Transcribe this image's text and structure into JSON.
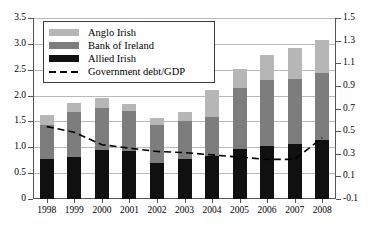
{
  "chart_data": {
    "type": "bar",
    "title": "",
    "subtitle": "",
    "xlabel": "",
    "ylabel": "",
    "y2label": "",
    "grid": true,
    "legend_position": "top-left",
    "categories": [
      "1998",
      "1999",
      "2000",
      "2001",
      "2002",
      "2003",
      "2004",
      "2005",
      "2006",
      "2007",
      "2008"
    ],
    "ylim": [
      0,
      3.5
    ],
    "yticks": [
      "0",
      "0.5",
      "1.0",
      "1.5",
      "2.0",
      "2.5",
      "3.0",
      "3.5"
    ],
    "ytick_values": [
      0,
      0.5,
      1.0,
      1.5,
      2.0,
      2.5,
      3.0,
      3.5
    ],
    "y2lim": [
      -0.1,
      1.5
    ],
    "y2ticks": [
      "-0.1",
      "0.1",
      "0.3",
      "0.5",
      "0.7",
      "0.9",
      "1.1",
      "1.3",
      "1.5"
    ],
    "y2tick_values": [
      -0.1,
      0.1,
      0.3,
      0.5,
      0.7,
      0.9,
      1.1,
      1.3,
      1.5
    ],
    "stacked": true,
    "series": [
      {
        "name": "Allied Irish",
        "key": "aib",
        "color": "#101010",
        "values": [
          0.78,
          0.82,
          0.95,
          0.92,
          0.7,
          0.77,
          0.83,
          0.97,
          1.02,
          1.07,
          1.15
        ]
      },
      {
        "name": "Bank of Ireland",
        "key": "boi",
        "color": "#7d7d7d",
        "values": [
          0.66,
          0.86,
          0.82,
          0.78,
          0.74,
          0.73,
          0.75,
          1.18,
          1.28,
          1.25,
          1.28
        ]
      },
      {
        "name": "Anglo Irish",
        "key": "anglo",
        "color": "#b6b6b6",
        "values": [
          0.19,
          0.17,
          0.18,
          0.14,
          0.13,
          0.19,
          0.52,
          0.36,
          0.49,
          0.61,
          0.65
        ]
      }
    ],
    "totals": [
      1.63,
      1.85,
      1.95,
      1.84,
      1.57,
      1.69,
      2.1,
      2.51,
      2.79,
      2.93,
      3.08
    ],
    "line_series": {
      "name": "Government  debt/GDP",
      "axis": "right",
      "style": "dashed",
      "color": "#000000",
      "values": [
        0.54,
        0.49,
        0.38,
        0.35,
        0.32,
        0.31,
        0.29,
        0.27,
        0.25,
        0.25,
        0.44
      ]
    }
  },
  "legend": {
    "items": [
      {
        "label": "Anglo Irish",
        "swatch": "anglo"
      },
      {
        "label": "Bank of Ireland",
        "swatch": "boi"
      },
      {
        "label": "Allied Irish",
        "swatch": "aib"
      },
      {
        "label": "Government  debt/GDP",
        "swatch": "dash"
      }
    ]
  }
}
